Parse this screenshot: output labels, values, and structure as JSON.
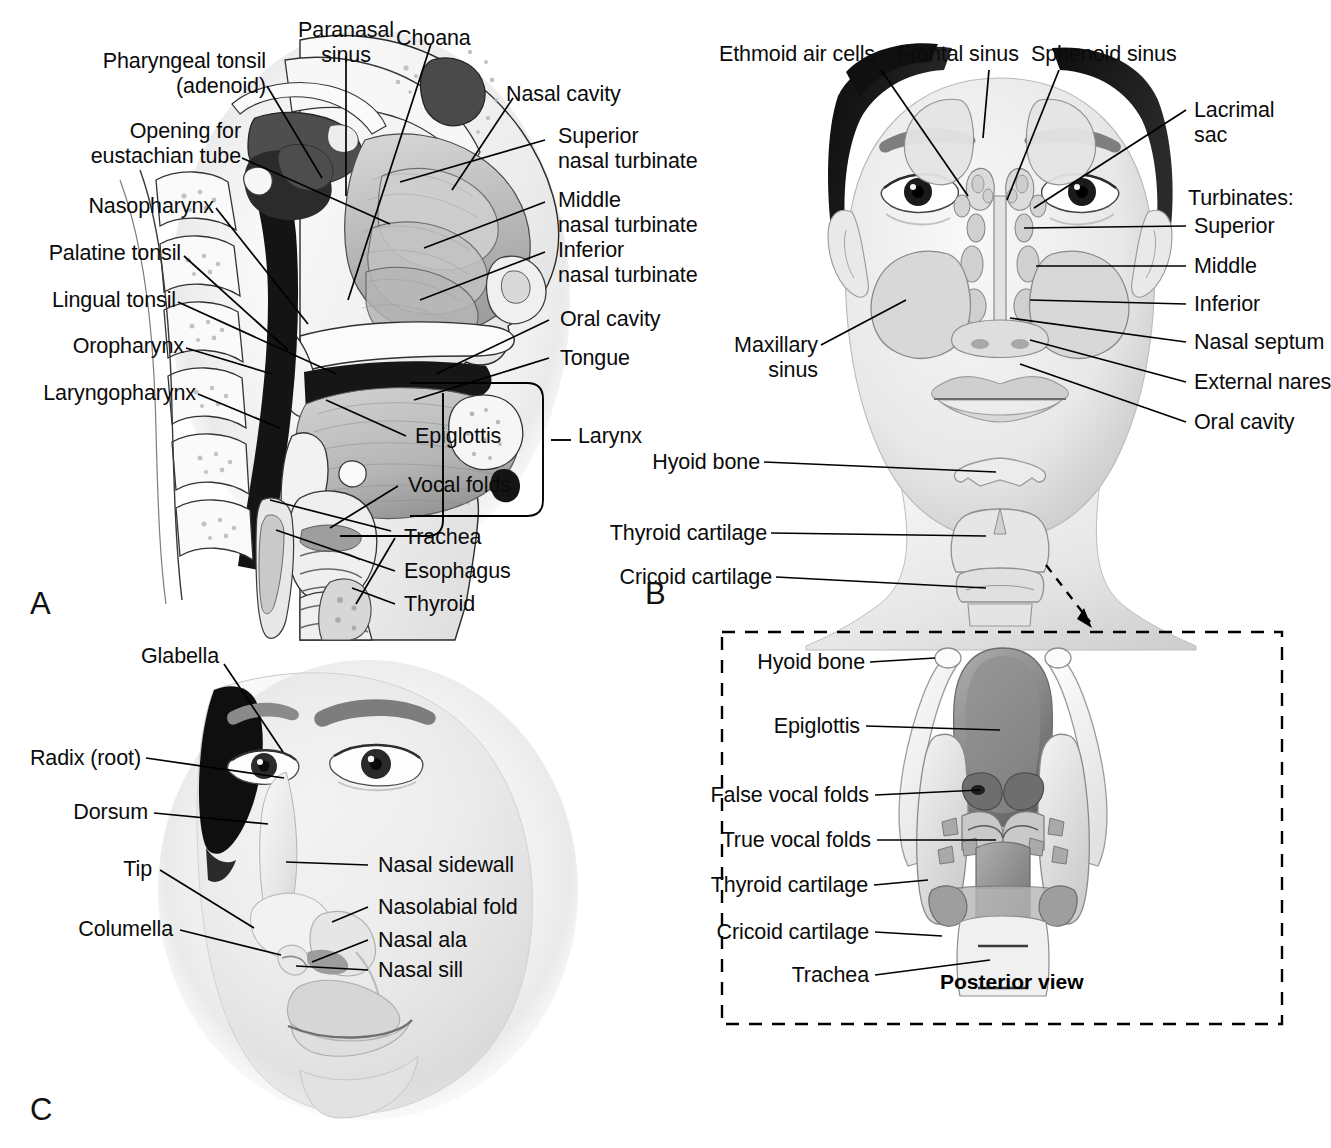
{
  "figure": {
    "background": "#ffffff",
    "line_color": "#000000"
  },
  "panels": [
    {
      "id": "A",
      "letter": "A",
      "name": "sagittal-section-upper-airway",
      "labels": [
        {
          "id": "pharyngeal-tonsil",
          "text": "Pharyngeal tonsil\n(adenoid)"
        },
        {
          "id": "paranasal-sinus",
          "text": "Paranasal\nsinus"
        },
        {
          "id": "choana",
          "text": "Choana"
        },
        {
          "id": "nasal-cavity",
          "text": "Nasal cavity"
        },
        {
          "id": "opening-eustachian",
          "text": "Opening for\neustachian tube"
        },
        {
          "id": "superior-turbinate",
          "text": "Superior\nnasal turbinate"
        },
        {
          "id": "middle-turbinate",
          "text": "Middle\nnasal turbinate"
        },
        {
          "id": "nasopharynx",
          "text": "Nasopharynx"
        },
        {
          "id": "inferior-turbinate",
          "text": "Inferior\nnasal turbinate"
        },
        {
          "id": "palatine-tonsil",
          "text": "Palatine tonsil"
        },
        {
          "id": "lingual-tonsil",
          "text": "Lingual tonsil"
        },
        {
          "id": "oral-cavity",
          "text": "Oral cavity"
        },
        {
          "id": "oropharynx",
          "text": "Oropharynx"
        },
        {
          "id": "tongue",
          "text": "Tongue"
        },
        {
          "id": "laryngopharynx",
          "text": "Laryngopharynx"
        },
        {
          "id": "epiglottis",
          "text": "Epiglottis"
        },
        {
          "id": "larynx",
          "text": "Larynx"
        },
        {
          "id": "vocal-folds",
          "text": "Vocal folds"
        },
        {
          "id": "trachea",
          "text": "Trachea"
        },
        {
          "id": "esophagus",
          "text": "Esophagus"
        },
        {
          "id": "thyroid",
          "text": "Thyroid"
        }
      ]
    },
    {
      "id": "B",
      "letter": "B",
      "name": "anterior-view-sinuses-larynx",
      "labels": [
        {
          "id": "ethmoid-air-cells",
          "text": "Ethmoid air cells"
        },
        {
          "id": "frontal-sinus",
          "text": "Frontal sinus"
        },
        {
          "id": "sphenoid-sinus",
          "text": "Sphenoid sinus"
        },
        {
          "id": "lacrimal-sac",
          "text": "Lacrimal\nsac"
        },
        {
          "id": "turbinates-heading",
          "text": "Turbinates:"
        },
        {
          "id": "turbinate-superior",
          "text": "Superior"
        },
        {
          "id": "turbinate-middle",
          "text": "Middle"
        },
        {
          "id": "turbinate-inferior",
          "text": "Inferior"
        },
        {
          "id": "maxillary-sinus",
          "text": "Maxillary\nsinus"
        },
        {
          "id": "nasal-septum",
          "text": "Nasal septum"
        },
        {
          "id": "external-nares",
          "text": "External nares"
        },
        {
          "id": "oral-cavity-b",
          "text": "Oral cavity"
        },
        {
          "id": "hyoid-bone-b",
          "text": "Hyoid bone"
        },
        {
          "id": "thyroid-cartilage-b",
          "text": "Thyroid cartilage"
        },
        {
          "id": "cricoid-cartilage-b",
          "text": "Cricoid cartilage"
        }
      ]
    },
    {
      "id": "C",
      "letter": "C",
      "name": "external-nose-landmarks",
      "labels": [
        {
          "id": "glabella",
          "text": "Glabella"
        },
        {
          "id": "radix",
          "text": "Radix (root)"
        },
        {
          "id": "dorsum",
          "text": "Dorsum"
        },
        {
          "id": "nasal-sidewall",
          "text": "Nasal sidewall"
        },
        {
          "id": "tip",
          "text": "Tip"
        },
        {
          "id": "nasolabial-fold",
          "text": "Nasolabial fold"
        },
        {
          "id": "nasal-ala",
          "text": "Nasal ala"
        },
        {
          "id": "columella",
          "text": "Columella"
        },
        {
          "id": "nasal-sill",
          "text": "Nasal sill"
        }
      ]
    },
    {
      "id": "inset",
      "letter": "",
      "name": "larynx-posterior-view-inset",
      "caption": "Posterior view",
      "labels": [
        {
          "id": "hyoid-bone-i",
          "text": "Hyoid bone"
        },
        {
          "id": "epiglottis-i",
          "text": "Epiglottis"
        },
        {
          "id": "false-vocal-folds",
          "text": "False vocal folds"
        },
        {
          "id": "true-vocal-folds",
          "text": "True vocal folds"
        },
        {
          "id": "thyroid-cartilage-i",
          "text": "Thyroid cartilage"
        },
        {
          "id": "cricoid-cartilage-i",
          "text": "Cricoid cartilage"
        },
        {
          "id": "trachea-i",
          "text": "Trachea"
        }
      ]
    }
  ],
  "text": {
    "A": {
      "pharyngeal_tonsil": "Pharyngeal tonsil",
      "adenoid": "(adenoid)",
      "paranasal": "Paranasal",
      "sinus": "sinus",
      "choana": "Choana",
      "nasal_cavity": "Nasal cavity",
      "opening_for": "Opening for",
      "eustachian_tube": "eustachian tube",
      "superior": "Superior",
      "superior_turbinate2": "nasal turbinate",
      "middle": "Middle",
      "middle_turbinate2": "nasal turbinate",
      "nasopharynx": "Nasopharynx",
      "inferior": "Inferior",
      "inferior_turbinate2": "nasal turbinate",
      "palatine_tonsil": "Palatine tonsil",
      "lingual_tonsil": "Lingual tonsil",
      "oral_cavity": "Oral cavity",
      "oropharynx": "Oropharynx",
      "tongue": "Tongue",
      "laryngopharynx": "Laryngopharynx",
      "epiglottis": "Epiglottis",
      "larynx": "Larynx",
      "vocal_folds": "Vocal folds",
      "trachea": "Trachea",
      "esophagus": "Esophagus",
      "thyroid": "Thyroid",
      "letter": "A"
    },
    "B": {
      "ethmoid_air_cells": "Ethmoid air cells",
      "frontal_sinus": "Frontal sinus",
      "sphenoid_sinus": "Sphenoid sinus",
      "lacrimal": "Lacrimal",
      "sac": "sac",
      "turbinates": "Turbinates:",
      "superior": "Superior",
      "middle": "Middle",
      "inferior": "Inferior",
      "maxillary": "Maxillary",
      "sinus": "sinus",
      "nasal_septum": "Nasal septum",
      "external_nares": "External nares",
      "oral_cavity": "Oral cavity",
      "hyoid_bone": "Hyoid bone",
      "thyroid_cartilage": "Thyroid cartilage",
      "cricoid_cartilage": "Cricoid cartilage",
      "letter": "B"
    },
    "C": {
      "glabella": "Glabella",
      "radix": "Radix (root)",
      "dorsum": "Dorsum",
      "nasal_sidewall": "Nasal sidewall",
      "tip": "Tip",
      "nasolabial_fold": "Nasolabial fold",
      "nasal_ala": "Nasal ala",
      "columella": "Columella",
      "nasal_sill": "Nasal sill",
      "letter": "C"
    },
    "inset": {
      "hyoid_bone": "Hyoid bone",
      "epiglottis": "Epiglottis",
      "false_vocal_folds": "False vocal folds",
      "true_vocal_folds": "True vocal folds",
      "thyroid_cartilage": "Thyroid cartilage",
      "cricoid_cartilage": "Cricoid cartilage",
      "trachea": "Trachea",
      "posterior_view": "Posterior view"
    }
  }
}
